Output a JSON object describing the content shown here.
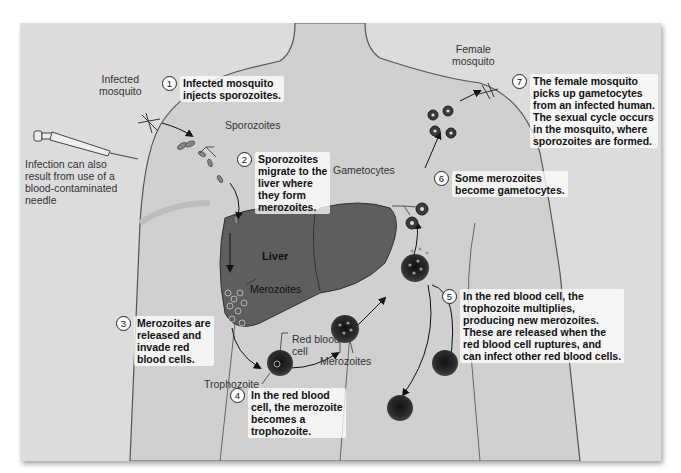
{
  "diagram": {
    "labels": {
      "infected_mosquito": "Infected\nmosquito",
      "female_mosquito": "Female\nmosquito",
      "sporozoites": "Sporozoites",
      "needle_note": "Infection can also\nresult from use of a\nblood-contaminated\nneedle",
      "liver": "Liver",
      "merozoites_liver": "Merozoites",
      "red_blood_cell": "Red blood\ncell",
      "trophozoite": "Trophozoite",
      "merozoites_blood": "Merozoites",
      "gametocytes": "Gametocytes"
    },
    "steps": [
      {
        "num": "1",
        "text": "Infected mosquito\ninjects sporozoites."
      },
      {
        "num": "2",
        "text": "Sporozoites\nmigrate to the\nliver where\nthey form\nmerozoites."
      },
      {
        "num": "3",
        "text": "Merozoites are\nreleased and\ninvade red\nblood cells."
      },
      {
        "num": "4",
        "text": "In the red blood\ncell, the merozoite\nbecomes a\ntrophozoite."
      },
      {
        "num": "5",
        "text": "In the red blood cell, the\ntrophozoite multiplies,\nproducing new merozoites.\nThese are released when the\nred blood cell ruptures, and\ncan infect other red blood cells."
      },
      {
        "num": "6",
        "text": "Some merozoites\nbecome gametocytes."
      },
      {
        "num": "7",
        "text": "The female mosquito\npicks up gametocytes\nfrom an infected human.\nThe sexual cycle occurs\nin the mosquito, where\nsporozoites are formed."
      }
    ],
    "colors": {
      "background": "#dcdcdc",
      "body": "#d2d2d2",
      "outline": "#555555",
      "liver": "#5a5a5a",
      "cell": "#2a2a2a"
    }
  }
}
